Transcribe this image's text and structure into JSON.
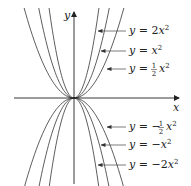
{
  "chart_data": {
    "type": "line",
    "title": "",
    "xlabel": "x",
    "ylabel": "y",
    "grid": false,
    "origin_px": [
      74,
      98
    ],
    "scale_k": 0.0724,
    "series": [
      {
        "name": "y = 2x^2",
        "coefficient": 2,
        "label": {
          "prefix": "y = 2",
          "var": "x",
          "exp": "2"
        }
      },
      {
        "name": "y = x^2",
        "coefficient": 1,
        "label": {
          "prefix": "y = ",
          "var": "x",
          "exp": "2"
        }
      },
      {
        "name": "y = (1/2)x^2",
        "coefficient": 0.5,
        "label": {
          "prefix": "y = ",
          "frac_num": "1",
          "frac_den": "2",
          "var": "x",
          "exp": "2"
        }
      },
      {
        "name": "y = -(1/2)x^2",
        "coefficient": -0.5,
        "label": {
          "prefix": "y = −",
          "frac_num": "1",
          "frac_den": "2",
          "var": "x",
          "exp": "2"
        }
      },
      {
        "name": "y = -x^2",
        "coefficient": -1,
        "label": {
          "prefix": "y = −",
          "var": "x",
          "exp": "2"
        }
      },
      {
        "name": "y = -2x^2",
        "coefficient": -2,
        "label": {
          "prefix": "y = −2",
          "var": "x",
          "exp": "2"
        }
      }
    ],
    "annotations": [
      {
        "text": "y = 2x²",
        "pointer_to": [
          97,
          31
        ],
        "label_pos": [
          128,
          34
        ]
      },
      {
        "text": "y = x²",
        "pointer_to": [
          100,
          51
        ],
        "label_pos": [
          128,
          54
        ]
      },
      {
        "text": "y = ½x²",
        "pointer_to": [
          106,
          69
        ],
        "label_pos": [
          128,
          72
        ]
      },
      {
        "text": "y = −½x²",
        "pointer_to": [
          106,
          127
        ],
        "label_pos": [
          128,
          130
        ]
      },
      {
        "text": "y = −x²",
        "pointer_to": [
          100,
          145
        ],
        "label_pos": [
          128,
          148
        ]
      },
      {
        "text": "y = −2x²",
        "pointer_to": [
          97,
          165
        ],
        "label_pos": [
          128,
          168
        ]
      }
    ]
  },
  "axes": {
    "x_label": "x",
    "y_label": "y"
  },
  "labels": {
    "l0": {
      "a": "y",
      "eq": " = 2",
      "v": "x",
      "e": "2"
    },
    "l1": {
      "a": "y",
      "eq": " = ",
      "v": "x",
      "e": "2"
    },
    "l2": {
      "a": "y",
      "eq": " = ",
      "n": "1",
      "d": "2",
      "v": "x",
      "e": "2"
    },
    "l3": {
      "a": "y",
      "eq": " = −",
      "n": "1",
      "d": "2",
      "v": "x",
      "e": "2"
    },
    "l4": {
      "a": "y",
      "eq": " = −",
      "v": "x",
      "e": "2"
    },
    "l5": {
      "a": "y",
      "eq": " = −2",
      "v": "x",
      "e": "2"
    }
  }
}
